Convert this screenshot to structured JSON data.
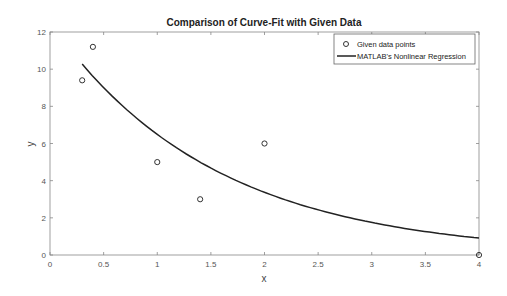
{
  "chart_data": {
    "type": "scatter",
    "title": "Comparison of Curve-Fit with Given Data",
    "xlabel": "x",
    "ylabel": "y",
    "xlim": [
      0,
      4
    ],
    "ylim": [
      0,
      12
    ],
    "xticks": [
      0,
      0.5,
      1,
      1.5,
      2,
      2.5,
      3,
      3.5,
      4
    ],
    "xtick_labels": [
      "0",
      "0.5",
      "1",
      "1.5",
      "2",
      "2.5",
      "3",
      "3.5",
      "4"
    ],
    "yticks": [
      0,
      2,
      4,
      6,
      8,
      10,
      12
    ],
    "ytick_labels": [
      "0",
      "2",
      "4",
      "6",
      "8",
      "10",
      "12"
    ],
    "grid": false,
    "legend_position": "northeast",
    "series": [
      {
        "name": "Given data points",
        "type": "scatter",
        "marker": "o",
        "x": [
          0.3,
          0.4,
          1,
          1.4,
          2,
          4
        ],
        "y": [
          9.4,
          11.2,
          5,
          3,
          6,
          0
        ]
      },
      {
        "name": "MATLAB's Nonlinear Regression",
        "type": "line",
        "model": "a*exp(b*x)",
        "a": 12.5,
        "b": -0.655,
        "x_range": [
          0.3,
          4
        ]
      }
    ]
  },
  "legend": {
    "items": [
      "Given data points",
      "MATLAB's Nonlinear Regression"
    ]
  }
}
